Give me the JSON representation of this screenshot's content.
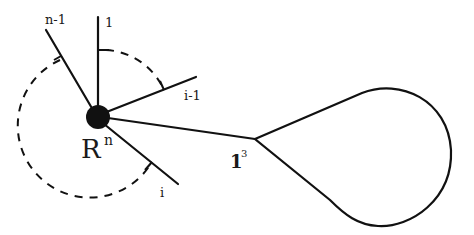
{
  "diagram": {
    "center_node": {
      "label": "R",
      "superscript": "n",
      "color": "#111111"
    },
    "spokes": [
      {
        "id": "spoke-1",
        "label": "1"
      },
      {
        "id": "spoke-n-1",
        "label": "n-1"
      },
      {
        "id": "spoke-i-1",
        "label": "i-1"
      },
      {
        "id": "spoke-i",
        "label": "i"
      }
    ],
    "junction_node": {
      "label": "1",
      "superscript": "3"
    },
    "loop": {
      "description": "closed loop (teardrop) attached at junction node"
    },
    "dashed_arcs": [
      {
        "from": "1",
        "to": "i-1"
      },
      {
        "from": "n-1",
        "to": "i"
      }
    ],
    "colors": {
      "stroke": "#111111",
      "background": "#ffffff"
    }
  }
}
